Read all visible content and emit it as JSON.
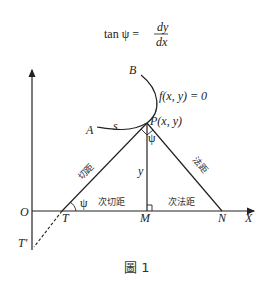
{
  "formula": {
    "lhs": "tan ψ =",
    "num": "dy",
    "den": "dx"
  },
  "labels": {
    "B": "B",
    "A": "A",
    "s": "s",
    "curve": "f(x, y) = 0",
    "P": "P(x, y)",
    "psi_top": "ψ",
    "psi_bottom": "ψ",
    "y": "y",
    "O": "O",
    "T": "T",
    "T_prime": "T'",
    "M": "M",
    "N": "N",
    "X": "X",
    "tangent": "切距",
    "normal": "法距",
    "subtangent": "次切距",
    "subnormal": "次法距"
  },
  "caption": "圖 1"
}
